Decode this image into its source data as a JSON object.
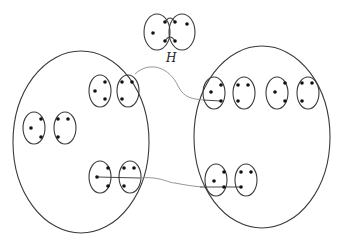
{
  "diagram": {
    "label_H": "H",
    "colors": {
      "stroke": "#3a3a3a",
      "dot": "#111111",
      "curve": "#8a8a8a",
      "background": "#ffffff"
    },
    "gadget_H": {
      "left_ellipse": {
        "cx": 157,
        "cy": 32,
        "rx": 13,
        "ry": 18
      },
      "right_ellipse": {
        "cx": 182,
        "cy": 32,
        "rx": 13,
        "ry": 18
      },
      "dots": [
        [
          153,
          33
        ],
        [
          165,
          22
        ],
        [
          165,
          41
        ],
        [
          175,
          22
        ],
        [
          175,
          41
        ],
        [
          187,
          24
        ]
      ]
    },
    "left_set": {
      "ellipse": {
        "cx": 81,
        "cy": 142,
        "rx": 68,
        "ry": 91
      }
    },
    "right_set": {
      "ellipse": {
        "cx": 262,
        "cy": 137,
        "rx": 68,
        "ry": 91
      }
    },
    "left_pairs": [
      {
        "a": {
          "cx": 100,
          "cy": 91
        },
        "b": {
          "cx": 128,
          "cy": 91
        }
      },
      {
        "a": {
          "cx": 34,
          "cy": 128
        },
        "b": {
          "cx": 65,
          "cy": 128
        }
      },
      {
        "a": {
          "cx": 100,
          "cy": 177
        },
        "b": {
          "cx": 130,
          "cy": 177
        }
      }
    ],
    "right_pairs": [
      {
        "a": {
          "cx": 214,
          "cy": 93
        },
        "b": {
          "cx": 244,
          "cy": 93
        }
      },
      {
        "a": {
          "cx": 277,
          "cy": 93
        },
        "b": {
          "cx": 308,
          "cy": 93
        }
      },
      {
        "a": {
          "cx": 216,
          "cy": 180
        },
        "b": {
          "cx": 246,
          "cy": 180
        }
      }
    ]
  }
}
